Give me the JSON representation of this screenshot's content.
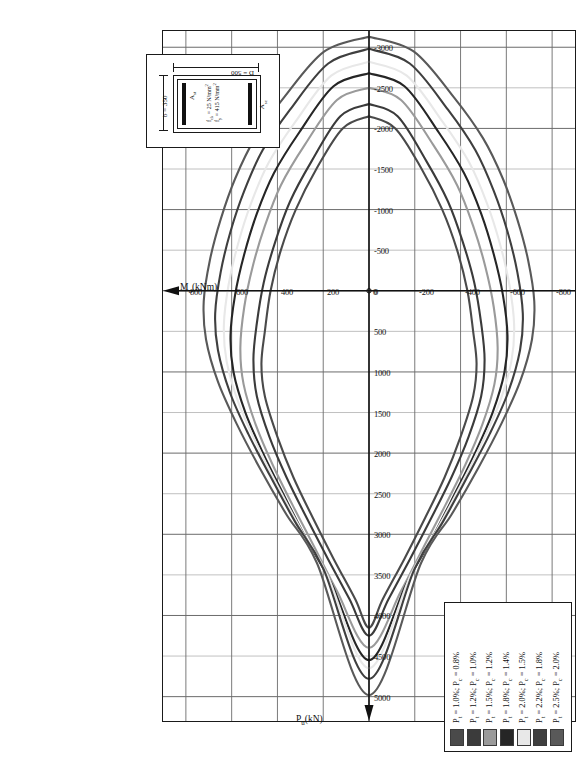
{
  "axes": {
    "x_title": "P",
    "x_title_sub": "u",
    "x_title_unit": "(kN)",
    "y_title": "M",
    "y_title_sub": "u",
    "y_title_unit": "(kNm)",
    "x_ticks": [
      5000,
      4500,
      4000,
      3500,
      3000,
      2500,
      2000,
      1500,
      1000,
      500,
      0,
      -500,
      -1000,
      -1500,
      -2000,
      -2500,
      -3000
    ],
    "y_ticks": [
      800,
      600,
      400,
      200,
      0,
      -200,
      -400,
      -600,
      -800
    ],
    "x_min": -3200,
    "x_max": 5300,
    "y_min": -900,
    "y_max": 900
  },
  "inset": {
    "depth_label": "D = 500",
    "width_label": "b = 350",
    "ast_top": "A",
    "ast_top_sub": "st",
    "ast_bottom": "A",
    "ast_bottom_sub": "sc",
    "fck_label": "f",
    "fck_sub": "ck",
    "fck_value": " = 25 N/mm",
    "fck_sup": "2",
    "fy_label": "f",
    "fy_sub": "y",
    "fy_value": " = 415 N/mm",
    "fy_sup": "2"
  },
  "legend": {
    "entries": [
      {
        "label_pt": "P",
        "sub": "t",
        "text": " = 1.0%; P",
        "sub2": "c",
        "text2": " = 0.8%",
        "color": "#4a4a4a"
      },
      {
        "label_pt": "P",
        "sub": "t",
        "text": " = 1.2%; P",
        "sub2": "c",
        "text2": " = 1.0%",
        "color": "#3b3b3b"
      },
      {
        "label_pt": "P",
        "sub": "t",
        "text": " = 1.5%; P",
        "sub2": "c",
        "text2": " = 1.2%",
        "color": "#9a9a9a"
      },
      {
        "label_pt": "P",
        "sub": "t",
        "text": " = 1.8%; P",
        "sub2": "c",
        "text2": " = 1.4%",
        "color": "#262626"
      },
      {
        "label_pt": "P",
        "sub": "t",
        "text": " = 2.0%; P",
        "sub2": "c",
        "text2": " = 1.5%",
        "color": "#e8e8e8"
      },
      {
        "label_pt": "P",
        "sub": "t",
        "text": " = 2.2%; P",
        "sub2": "c",
        "text2": " = 1.8%",
        "color": "#3f3f3f"
      },
      {
        "label_pt": "P",
        "sub": "t",
        "text": " = 2.5%; P",
        "sub2": "c",
        "text2": " = 2.0%",
        "color": "#595959"
      }
    ]
  },
  "chart_data": {
    "type": "line",
    "title": "",
    "xlabel": "Pu (kN)",
    "ylabel": "Mu (kNm)",
    "xlim": [
      -3200,
      5300
    ],
    "ylim": [
      -900,
      900
    ],
    "grid": true,
    "legend_position": "bottom-left",
    "note": "Axial load - moment (P-M) interaction envelopes for a 350x500 RC section, fck=25 N/mm2, fy=415 N/mm2. Each closed curve is one reinforcement ratio pair.",
    "series": [
      {
        "name": "Pt = 1.0%; Pc = 0.8%",
        "color": "#4a4a4a",
        "points": [
          [
            -2150,
            0
          ],
          [
            -2000,
            -115
          ],
          [
            -1500,
            -230
          ],
          [
            -1000,
            -320
          ],
          [
            -500,
            -385
          ],
          [
            0,
            -430
          ],
          [
            500,
            -455
          ],
          [
            900,
            -470
          ],
          [
            1300,
            -455
          ],
          [
            1800,
            -400
          ],
          [
            2300,
            -330
          ],
          [
            2800,
            -245
          ],
          [
            3300,
            -155
          ],
          [
            3800,
            -60
          ],
          [
            4150,
            0
          ],
          [
            3800,
            60
          ],
          [
            3300,
            155
          ],
          [
            2800,
            245
          ],
          [
            2300,
            330
          ],
          [
            1800,
            400
          ],
          [
            1300,
            455
          ],
          [
            900,
            470
          ],
          [
            500,
            455
          ],
          [
            0,
            430
          ],
          [
            -500,
            385
          ],
          [
            -1000,
            320
          ],
          [
            -1500,
            230
          ],
          [
            -2000,
            115
          ],
          [
            -2150,
            0
          ]
        ]
      },
      {
        "name": "Pt = 1.2%; Pc = 1.0%",
        "color": "#3b3b3b",
        "points": [
          [
            -2300,
            0
          ],
          [
            -2150,
            -125
          ],
          [
            -1600,
            -250
          ],
          [
            -1100,
            -345
          ],
          [
            -600,
            -410
          ],
          [
            -100,
            -460
          ],
          [
            400,
            -490
          ],
          [
            850,
            -505
          ],
          [
            1300,
            -490
          ],
          [
            1800,
            -435
          ],
          [
            2300,
            -360
          ],
          [
            2800,
            -272
          ],
          [
            3300,
            -180
          ],
          [
            3800,
            -85
          ],
          [
            4250,
            0
          ],
          [
            3800,
            85
          ],
          [
            3300,
            180
          ],
          [
            2800,
            272
          ],
          [
            2300,
            360
          ],
          [
            1800,
            435
          ],
          [
            1300,
            490
          ],
          [
            850,
            505
          ],
          [
            400,
            490
          ],
          [
            -100,
            460
          ],
          [
            -600,
            410
          ],
          [
            -1100,
            345
          ],
          [
            -1600,
            250
          ],
          [
            -2150,
            125
          ],
          [
            -2300,
            0
          ]
        ]
      },
      {
        "name": "Pt = 1.5%; Pc = 1.2%",
        "color": "#9a9a9a",
        "points": [
          [
            -2500,
            0
          ],
          [
            -2350,
            -140
          ],
          [
            -1800,
            -280
          ],
          [
            -1300,
            -385
          ],
          [
            -800,
            -455
          ],
          [
            -300,
            -508
          ],
          [
            200,
            -545
          ],
          [
            700,
            -562
          ],
          [
            1150,
            -548
          ],
          [
            1650,
            -495
          ],
          [
            2150,
            -420
          ],
          [
            2650,
            -332
          ],
          [
            3150,
            -240
          ],
          [
            3700,
            -140
          ],
          [
            4400,
            0
          ],
          [
            3700,
            140
          ],
          [
            3150,
            240
          ],
          [
            2650,
            332
          ],
          [
            2150,
            420
          ],
          [
            1650,
            495
          ],
          [
            1150,
            548
          ],
          [
            700,
            562
          ],
          [
            200,
            545
          ],
          [
            -300,
            508
          ],
          [
            -800,
            455
          ],
          [
            -1300,
            385
          ],
          [
            -1800,
            280
          ],
          [
            -2350,
            140
          ],
          [
            -2500,
            0
          ]
        ]
      },
      {
        "name": "Pt = 1.8%; Pc = 1.4%",
        "color": "#262626",
        "points": [
          [
            -2680,
            0
          ],
          [
            -2520,
            -155
          ],
          [
            -1950,
            -305
          ],
          [
            -1450,
            -415
          ],
          [
            -950,
            -490
          ],
          [
            -450,
            -545
          ],
          [
            50,
            -585
          ],
          [
            550,
            -605
          ],
          [
            1000,
            -592
          ],
          [
            1500,
            -540
          ],
          [
            2000,
            -463
          ],
          [
            2500,
            -375
          ],
          [
            3050,
            -275
          ],
          [
            3600,
            -165
          ],
          [
            4550,
            0
          ],
          [
            3600,
            165
          ],
          [
            3050,
            275
          ],
          [
            2500,
            375
          ],
          [
            2000,
            463
          ],
          [
            1500,
            540
          ],
          [
            1000,
            592
          ],
          [
            550,
            605
          ],
          [
            50,
            585
          ],
          [
            -450,
            545
          ],
          [
            -950,
            490
          ],
          [
            -1450,
            415
          ],
          [
            -1950,
            305
          ],
          [
            -2520,
            155
          ],
          [
            -2680,
            0
          ]
        ]
      },
      {
        "name": "Pt = 2.0%; Pc = 1.5%",
        "color": "#e8e8e8",
        "points": [
          [
            -2820,
            0
          ],
          [
            -2650,
            -165
          ],
          [
            -2080,
            -322
          ],
          [
            -1580,
            -438
          ],
          [
            -1080,
            -515
          ],
          [
            -580,
            -572
          ],
          [
            -80,
            -613
          ],
          [
            420,
            -634
          ],
          [
            870,
            -622
          ],
          [
            1380,
            -570
          ],
          [
            1880,
            -492
          ],
          [
            2400,
            -400
          ],
          [
            2950,
            -295
          ],
          [
            3500,
            -182
          ],
          [
            4650,
            0
          ],
          [
            3500,
            182
          ],
          [
            2950,
            295
          ],
          [
            2400,
            400
          ],
          [
            1880,
            492
          ],
          [
            1380,
            570
          ],
          [
            870,
            622
          ],
          [
            420,
            634
          ],
          [
            -80,
            613
          ],
          [
            -580,
            572
          ],
          [
            -1080,
            515
          ],
          [
            -1580,
            438
          ],
          [
            -2080,
            322
          ],
          [
            -2650,
            165
          ],
          [
            -2820,
            0
          ]
        ]
      },
      {
        "name": "Pt = 2.2%; Pc = 1.8%",
        "color": "#3f3f3f",
        "points": [
          [
            -2980,
            0
          ],
          [
            -2800,
            -178
          ],
          [
            -2230,
            -345
          ],
          [
            -1730,
            -465
          ],
          [
            -1230,
            -545
          ],
          [
            -730,
            -605
          ],
          [
            -230,
            -648
          ],
          [
            280,
            -672
          ],
          [
            730,
            -660
          ],
          [
            1250,
            -608
          ],
          [
            1760,
            -528
          ],
          [
            2280,
            -432
          ],
          [
            2850,
            -322
          ],
          [
            3420,
            -200
          ],
          [
            4780,
            0
          ],
          [
            3420,
            200
          ],
          [
            2850,
            322
          ],
          [
            2280,
            432
          ],
          [
            1760,
            528
          ],
          [
            1250,
            608
          ],
          [
            730,
            660
          ],
          [
            280,
            672
          ],
          [
            -230,
            648
          ],
          [
            -730,
            605
          ],
          [
            -1230,
            545
          ],
          [
            -1730,
            465
          ],
          [
            -2230,
            345
          ],
          [
            -2800,
            178
          ],
          [
            -2980,
            0
          ]
        ]
      },
      {
        "name": "Pt = 2.5%; Pc = 2.0%",
        "color": "#595959",
        "points": [
          [
            -3130,
            0
          ],
          [
            -2950,
            -195
          ],
          [
            -2380,
            -372
          ],
          [
            -1880,
            -498
          ],
          [
            -1380,
            -585
          ],
          [
            -880,
            -648
          ],
          [
            -380,
            -695
          ],
          [
            130,
            -722
          ],
          [
            600,
            -712
          ],
          [
            1120,
            -660
          ],
          [
            1640,
            -578
          ],
          [
            2180,
            -478
          ],
          [
            2760,
            -360
          ],
          [
            3350,
            -228
          ],
          [
            4980,
            0
          ],
          [
            3350,
            228
          ],
          [
            2760,
            360
          ],
          [
            2180,
            478
          ],
          [
            1640,
            578
          ],
          [
            1120,
            660
          ],
          [
            600,
            712
          ],
          [
            130,
            722
          ],
          [
            -380,
            695
          ],
          [
            -880,
            648
          ],
          [
            -1380,
            585
          ],
          [
            -1880,
            498
          ],
          [
            -2380,
            372
          ],
          [
            -2950,
            195
          ],
          [
            -3130,
            0
          ]
        ]
      }
    ]
  }
}
